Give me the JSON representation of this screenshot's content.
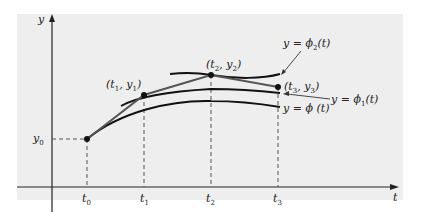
{
  "figure": {
    "axes": {
      "x_label": "t",
      "y_label": "y"
    },
    "ticks": {
      "t0": {
        "base": "t",
        "sub": "0"
      },
      "t1": {
        "base": "t",
        "sub": "1"
      },
      "t2": {
        "base": "t",
        "sub": "2"
      },
      "t3": {
        "base": "t",
        "sub": "3"
      },
      "y0": {
        "base": "y",
        "sub": "0"
      }
    },
    "points": {
      "p1": {
        "open": "(",
        "t": "t",
        "ts": "1",
        "comma": ", ",
        "y": "y",
        "ys": "1",
        "close": ")"
      },
      "p2": {
        "open": "(",
        "t": "t",
        "ts": "2",
        "comma": ", ",
        "y": "y",
        "ys": "2",
        "close": ")"
      },
      "p3": {
        "open": "(",
        "t": "t",
        "ts": "3",
        "comma": ", ",
        "y": "y",
        "ys": "3",
        "close": ")"
      }
    },
    "curve_labels": {
      "phi2": {
        "prefix": "y = ϕ",
        "sub": "2",
        "suffix": "(t)"
      },
      "phi1": {
        "prefix": "y = ϕ",
        "sub": "1",
        "suffix": "(t)"
      },
      "phi": {
        "text": "y = ϕ (t)"
      }
    }
  }
}
